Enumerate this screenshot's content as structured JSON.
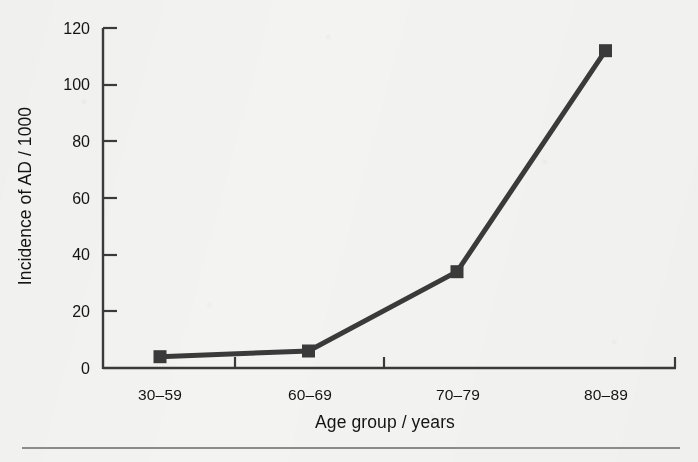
{
  "figure": {
    "background_color": "#f3f3f1",
    "ink_color": "#3a3a3a",
    "rule_color": "#8c8c8c"
  },
  "chart_data": {
    "type": "line",
    "title": "",
    "subtitle": "",
    "xlabel": "Age group / years",
    "ylabel": "Incidence of AD / 1000",
    "categories": [
      "30–59",
      "60–69",
      "70–79",
      "80–89"
    ],
    "values": [
      4,
      6,
      34,
      112
    ],
    "series": [
      {
        "name": "Incidence of AD",
        "values": [
          4,
          6,
          34,
          112
        ],
        "line_color": "#3a3a3a",
        "marker": "square",
        "marker_color": "#3a3a3a"
      }
    ],
    "ylim": [
      0,
      120
    ],
    "yticks": [
      0,
      20,
      40,
      60,
      80,
      100,
      120
    ],
    "ytick_labels": [
      "0",
      "20",
      "40",
      "60",
      "80",
      "100",
      "120"
    ],
    "xtick_labels": [
      "30–59",
      "60–69",
      "70–79",
      "80–89"
    ],
    "grid": false,
    "legend": false,
    "legend_position": "none"
  },
  "axes": {
    "y_title": "Incidence of AD / 1000",
    "x_title": "Age group / years",
    "y_labels": {
      "t0": "0",
      "t20": "20",
      "t40": "40",
      "t60": "60",
      "t80": "80",
      "t100": "100",
      "t120": "120"
    },
    "x_labels": {
      "c0": "30–59",
      "c1": "60–69",
      "c2": "70–79",
      "c3": "80–89"
    }
  }
}
